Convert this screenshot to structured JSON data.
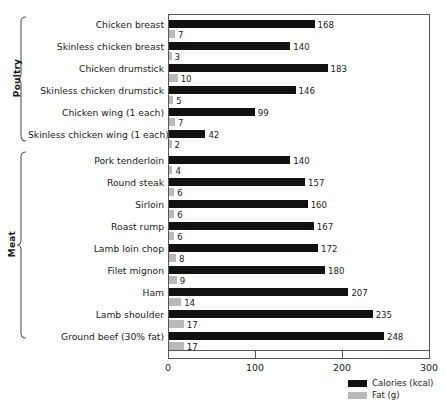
{
  "chart_data": {
    "type": "bar",
    "orientation": "horizontal",
    "title": "",
    "xlabel": "",
    "ylabel": "",
    "xlim": [
      0,
      300
    ],
    "xticks": [
      0,
      100,
      200,
      300
    ],
    "grid": false,
    "legend_position": "bottom-right",
    "categories": [
      "Chicken breast",
      "Skinless chicken breast",
      "Chicken drumstick",
      "Skinless chicken drumstick",
      "Chicken wing (1 each)",
      "Skinless chicken wing (1 each)",
      "Pork tenderloin",
      "Round steak",
      "Sirloin",
      "Roast rump",
      "Lamb loin chop",
      "Filet mignon",
      "Ham",
      "Lamb shoulder",
      "Ground beef (30% fat)"
    ],
    "series": [
      {
        "name": "Calories (kcal)",
        "color": "#111111",
        "values": [
          168,
          140,
          183,
          146,
          99,
          42,
          140,
          157,
          160,
          167,
          172,
          180,
          207,
          235,
          248
        ]
      },
      {
        "name": "Fat (g)",
        "color": "#b9b9b9",
        "values": [
          7,
          3,
          10,
          5,
          7,
          2,
          4,
          6,
          6,
          6,
          8,
          9,
          14,
          17,
          17
        ]
      }
    ],
    "groups": [
      {
        "label": "Poultry",
        "start_index": 0,
        "end_index": 5
      },
      {
        "label": "Meat",
        "start_index": 6,
        "end_index": 14
      }
    ]
  },
  "legend": {
    "entries": [
      {
        "label": "Calories (kcal)",
        "color": "#111111"
      },
      {
        "label": "Fat (g)",
        "color": "#b9b9b9"
      }
    ]
  },
  "axis": {
    "tick_labels": [
      "0",
      "100",
      "200",
      "300"
    ]
  }
}
